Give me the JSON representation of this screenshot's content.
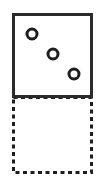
{
  "canvas": {
    "width": 101,
    "height": 183,
    "background": "#ffffff"
  },
  "shapes": {
    "solid_square": {
      "label": "solid-square",
      "x": 13.5,
      "y": 14.5,
      "width": 78,
      "height": 82,
      "stroke": "#2b2b2b",
      "stroke_width": 3,
      "fill": "#ffffff",
      "style": "solid"
    },
    "dashed_square": {
      "label": "dashed-square",
      "x": 13.5,
      "y": 97.5,
      "width": 78,
      "height": 75,
      "stroke": "#1e1e1e",
      "stroke_width": 3,
      "fill": "#ffffff",
      "style": "dashed",
      "dash_length": 4,
      "dash_gap": 3.5
    },
    "circles": [
      {
        "label": "ring-1",
        "cx": 32,
        "cy": 34,
        "r": 5,
        "stroke": "#1e1e1e",
        "stroke_width": 3,
        "fill": "#ffffff"
      },
      {
        "label": "ring-2",
        "cx": 53,
        "cy": 54,
        "r": 5,
        "stroke": "#1e1e1e",
        "stroke_width": 3,
        "fill": "#ffffff"
      },
      {
        "label": "ring-3",
        "cx": 74,
        "cy": 74,
        "r": 5,
        "stroke": "#1e1e1e",
        "stroke_width": 3,
        "fill": "#ffffff"
      }
    ]
  },
  "colors": {
    "outline": "#2b2b2b",
    "ring": "#1e1e1e",
    "background": "#ffffff"
  }
}
